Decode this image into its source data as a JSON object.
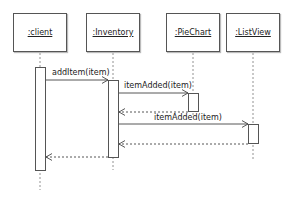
{
  "diagram": {
    "type": "sequence",
    "objects": [
      {
        "id": "client",
        "label": ":client"
      },
      {
        "id": "inventory",
        "label": ":Inventory"
      },
      {
        "id": "piechart",
        "label": ":PieChart"
      },
      {
        "id": "listview",
        "label": ":ListView"
      }
    ],
    "messages": [
      {
        "from": "client",
        "to": "inventory",
        "label": "addItem(item)",
        "kind": "call"
      },
      {
        "from": "inventory",
        "to": "piechart",
        "label": "itemAdded(item)",
        "kind": "call"
      },
      {
        "from": "piechart",
        "to": "inventory",
        "label": "",
        "kind": "return"
      },
      {
        "from": "inventory",
        "to": "listview",
        "label": "itemAdded(item)",
        "kind": "call"
      },
      {
        "from": "listview",
        "to": "inventory",
        "label": "",
        "kind": "return"
      },
      {
        "from": "inventory",
        "to": "client",
        "label": "",
        "kind": "return"
      }
    ]
  }
}
